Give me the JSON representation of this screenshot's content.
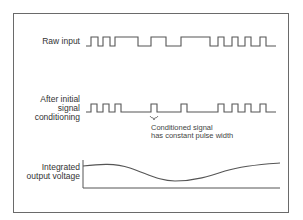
{
  "diagram": {
    "type": "signal-timing",
    "rows": [
      {
        "id": "raw",
        "label_lines": [
          "Raw input"
        ]
      },
      {
        "id": "conditioned",
        "label_lines": [
          "After initial",
          "signal",
          "conditioning"
        ]
      },
      {
        "id": "integrated",
        "label_lines": [
          "Integrated",
          "output voltage"
        ]
      }
    ],
    "annotation": {
      "lines": [
        "Conditioned signal",
        "has constant pulse width"
      ]
    },
    "colors": {
      "line": "#555555",
      "frame": "#6a6a6a",
      "text": "#333333"
    }
  }
}
